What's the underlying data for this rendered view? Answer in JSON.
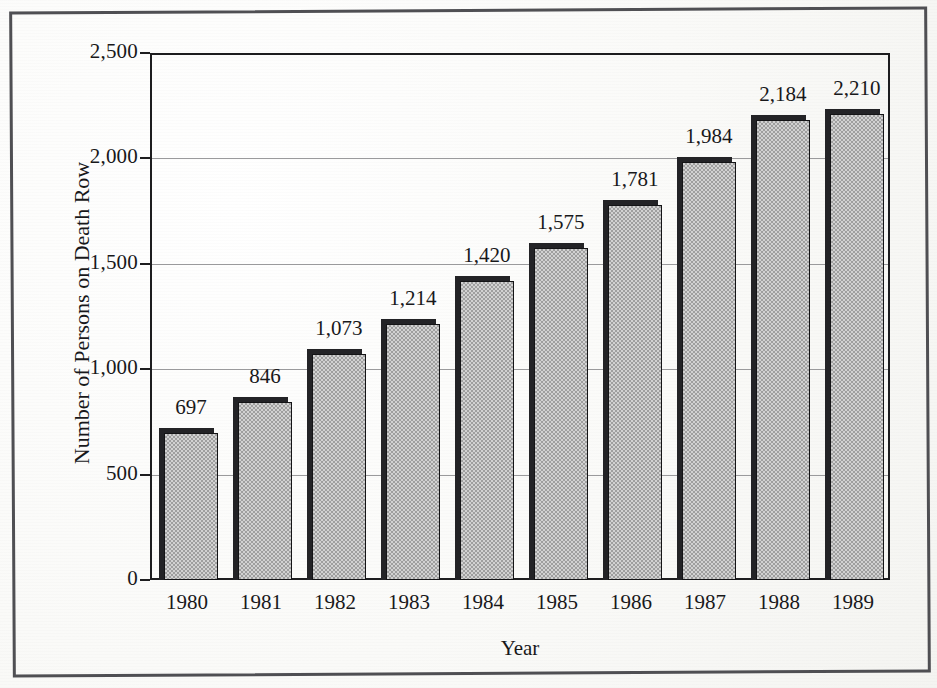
{
  "chart_data": {
    "type": "bar",
    "title": "",
    "xlabel": "Year",
    "ylabel": "Number of Persons on Death Row",
    "categories": [
      "1980",
      "1981",
      "1982",
      "1983",
      "1984",
      "1985",
      "1986",
      "1987",
      "1988",
      "1989"
    ],
    "values": [
      697,
      846,
      1073,
      1214,
      1420,
      1575,
      1781,
      1984,
      2184,
      2210
    ],
    "value_labels": [
      "697",
      "846",
      "1,073",
      "1,214",
      "1,420",
      "1,575",
      "1,781",
      "1,984",
      "2,184",
      "2,210"
    ],
    "ylim": [
      0,
      2500
    ],
    "ytick_values": [
      0,
      500,
      1000,
      1500,
      2000,
      2500
    ],
    "ytick_labels": [
      "0",
      "500",
      "1,000",
      "1,500",
      "2,000",
      "2,500"
    ],
    "grid": true,
    "grid_axis": "y",
    "legend": "none",
    "bar_fill_color": "#b3b3b3",
    "bar_edge_color": "#141416",
    "background_color": "#fcfcfb",
    "axis_color": "#1d1d1f",
    "gridline_color": "#9a9a9c"
  },
  "frame": {
    "border_color": "#4f4f53"
  }
}
